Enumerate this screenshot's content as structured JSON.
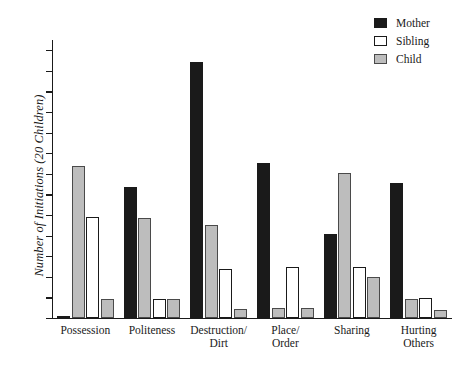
{
  "chart_data": {
    "type": "bar",
    "title": "",
    "xlabel": "",
    "ylabel": "Number of Initiations (20 Children)",
    "ylim": [
      0,
      27
    ],
    "ytick_step": 2,
    "yticks": [
      0,
      2,
      4,
      6,
      8,
      10,
      12,
      14,
      16,
      18,
      20,
      22,
      24,
      26
    ],
    "grid": false,
    "legend_position": "top-right",
    "categories": [
      "Possession",
      "Politeness",
      "Destruction/\nDirt",
      "Place/\nOrder",
      "Sharing",
      "Hurting\nOthers"
    ],
    "series": [
      {
        "name": "Mother",
        "color": "#1a1a1a",
        "values": [
          0.1,
          12.7,
          24.9,
          15.1,
          8.2,
          13.1
        ]
      },
      {
        "name": "Sibling",
        "color": "#ffffff",
        "values": [
          9.8,
          1.8,
          4.8,
          5.0,
          5.0,
          1.9
        ]
      },
      {
        "name": "Child",
        "color": "#bdbdbd",
        "values": [
          14.8,
          9.7,
          9.0,
          1.0,
          14.1,
          1.8
        ]
      }
    ],
    "extra_child_bars": {
      "note": "trailing light bars at group ends",
      "values": [
        1.8,
        1.8,
        0.9,
        1.0,
        4.0,
        0.8
      ]
    }
  },
  "legend": {
    "items": [
      {
        "label": "Mother",
        "swatch": "mother-swatch"
      },
      {
        "label": "Sibling",
        "swatch": "sibling-swatch"
      },
      {
        "label": "Child",
        "swatch": "child-swatch"
      }
    ]
  }
}
